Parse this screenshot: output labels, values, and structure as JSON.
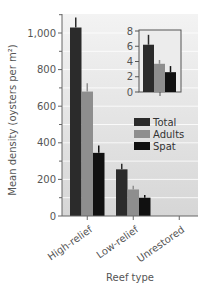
{
  "chart_data": {
    "type": "bar",
    "title": "",
    "xlabel": "Reef type",
    "ylabel": "Mean density (oysters per m²)",
    "ylim": [
      0,
      1100
    ],
    "yticks": [
      0,
      200,
      400,
      600,
      800,
      1000
    ],
    "ytick_labels": [
      "0",
      "200",
      "400",
      "600",
      "800",
      "1,000"
    ],
    "categories": [
      "High-relief",
      "Low-relief",
      "Unrestored"
    ],
    "series": [
      {
        "name": "Total",
        "color": "#2b2b2b",
        "values": [
          1030,
          255,
          6.2
        ],
        "errors": [
          55,
          30,
          1.3
        ]
      },
      {
        "name": "Adults",
        "color": "#8e8e8e",
        "values": [
          680,
          145,
          3.7
        ],
        "errors": [
          45,
          20,
          0.5
        ]
      },
      {
        "name": "Spat",
        "color": "#111111",
        "values": [
          345,
          100,
          2.6
        ],
        "errors": [
          40,
          15,
          0.8
        ]
      }
    ],
    "legend": {
      "position": "upper right, below inset",
      "entries": [
        "Total",
        "Adults",
        "Spat"
      ]
    },
    "grid": true,
    "inset": {
      "category": "Unrestored",
      "ylim": [
        0,
        8
      ],
      "yticks": [
        0,
        2,
        4,
        6,
        8
      ],
      "ytick_labels": [
        "0",
        "2",
        "4",
        "6",
        "8"
      ],
      "values": {
        "Total": 6.2,
        "Adults": 3.7,
        "Spat": 2.6
      },
      "errors": {
        "Total": 1.3,
        "Adults": 0.5,
        "Spat": 0.8
      }
    }
  }
}
